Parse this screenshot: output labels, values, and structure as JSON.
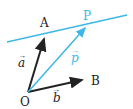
{
  "colors": {
    "line": "#3db8e6",
    "vector": "#222222",
    "accent": "#3db8e6"
  },
  "labels": {
    "O": "O",
    "A": "A",
    "B": "B",
    "P": "P",
    "a": "a",
    "b": "b",
    "p": "p"
  }
}
